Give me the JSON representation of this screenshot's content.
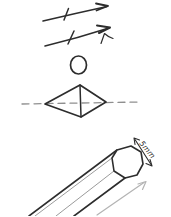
{
  "canvas": {
    "width": "171",
    "height": "216",
    "background": "#ffffff",
    "ink": "#2d2d2d",
    "muted": "#8f8f8f",
    "faint": "#b3b3b3"
  },
  "labels": {
    "size": "5mm"
  },
  "sketch": {
    "parts": [
      "upper-arrow-with-tick",
      "lower-arrow-with-tick-and-hook",
      "small-circle",
      "diamond-with-internal-edge",
      "dashed-horizontal-axis",
      "hexagonal-pencil-prism",
      "octagonal-end-face",
      "width-measurement-double-arrow",
      "length-direction-arrow"
    ]
  }
}
